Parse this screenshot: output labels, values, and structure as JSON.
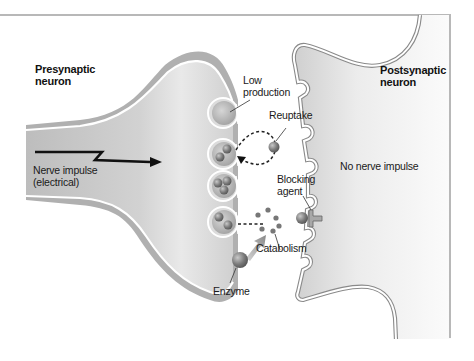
{
  "diagram": {
    "colors": {
      "membrane_outer": "#9a9a9a",
      "membrane_inner": "#ffffff",
      "presynaptic_fill": "#c9c9c9",
      "postsynaptic_fill": "#e4e4e4",
      "vesicle_fill": "#b5b5b5",
      "molecule": "#7d7d7d",
      "arrow": "#111111",
      "enzyme_arrow": "#9c9c9c",
      "frame": "#b8b8b8"
    },
    "labels": {
      "presynaptic": [
        "Presynaptic",
        "neuron"
      ],
      "postsynaptic": [
        "Postsynaptic",
        "neuron"
      ],
      "low_production": [
        "Low",
        "production"
      ],
      "reuptake": "Reuptake",
      "nerve_impulse": [
        "Nerve impulse",
        "(electrical)"
      ],
      "no_nerve_impulse": "No nerve impulse",
      "blocking_agent": [
        "Blocking",
        "agent"
      ],
      "catabolism": "Catabolism",
      "enzyme": "Enzyme"
    },
    "nodes": [
      {
        "id": "presynaptic-neuron",
        "label": "Presynaptic neuron"
      },
      {
        "id": "postsynaptic-neuron",
        "label": "Postsynaptic neuron"
      },
      {
        "id": "vesicle-1",
        "label": "Low production",
        "molecules": 0
      },
      {
        "id": "vesicle-2",
        "label": "Reuptake target",
        "molecules": 2
      },
      {
        "id": "vesicle-3",
        "label": "",
        "molecules": 3
      },
      {
        "id": "vesicle-4",
        "label": "Catabolism source",
        "molecules": 2
      },
      {
        "id": "receptor-blocked",
        "label": "Blocking agent"
      },
      {
        "id": "enzyme",
        "label": "Enzyme"
      }
    ],
    "edges": [
      {
        "from": "nerve-impulse",
        "to": "presynaptic-terminal",
        "label": "Nerve impulse (electrical)"
      },
      {
        "from": "reuptake-molecule",
        "to": "vesicle-2",
        "label": "Reuptake",
        "style": "dashed"
      },
      {
        "from": "vesicle-4",
        "to": "catabolism",
        "label": "",
        "style": "dashed"
      },
      {
        "from": "enzyme",
        "to": "catabolism",
        "label": "",
        "style": "thick-arrow"
      }
    ]
  }
}
